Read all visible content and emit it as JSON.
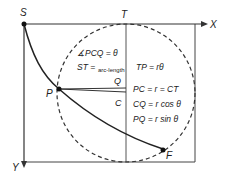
{
  "diagram": {
    "points": {
      "S": "S",
      "T": "T",
      "X": "X",
      "Y": "Y",
      "P": "P",
      "Q": "Q",
      "C": "C",
      "F": "F"
    },
    "equations": {
      "angle": "∡PCQ = θ",
      "st_prefix": "ST =",
      "st_sub": "arc-length",
      "st_suffix": "TP = rθ",
      "pc": "PC = r = CT",
      "cq": "CQ = r cos θ",
      "pq": "PQ = r sin θ"
    },
    "colors": {
      "line": "#333333",
      "text": "#222222",
      "background": "#ffffff"
    }
  }
}
